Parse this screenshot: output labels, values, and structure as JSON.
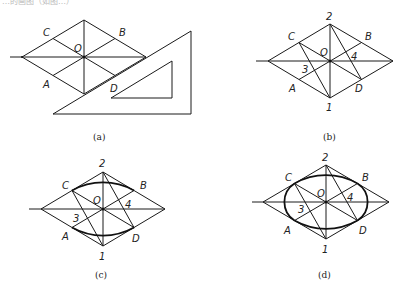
{
  "header": {
    "cropped_text": "…的画图（如图…）"
  },
  "panels": [
    {
      "id": "a",
      "caption": "(a)",
      "labels": {
        "C": "C",
        "B": "B",
        "O": "O",
        "A": "A",
        "D": "D"
      },
      "tool": "set-square"
    },
    {
      "id": "b",
      "caption": "(b)",
      "labels": {
        "C": "C",
        "B": "B",
        "O": "O",
        "A": "A",
        "D": "D",
        "p1": "1",
        "p2": "2",
        "p3": "3",
        "p4": "4"
      }
    },
    {
      "id": "c",
      "caption": "(c)",
      "labels": {
        "C": "C",
        "B": "B",
        "O": "O",
        "A": "A",
        "D": "D",
        "p1": "1",
        "p2": "2",
        "p3": "3",
        "p4": "4"
      }
    },
    {
      "id": "d",
      "caption": "(d)",
      "labels": {
        "C": "C",
        "B": "B",
        "O": "O",
        "A": "A",
        "D": "D",
        "p1": "1",
        "p2": "2",
        "p3": "3",
        "p4": "4"
      }
    }
  ],
  "colors": {
    "line": "#1a1a1a",
    "background": "#ffffff"
  }
}
